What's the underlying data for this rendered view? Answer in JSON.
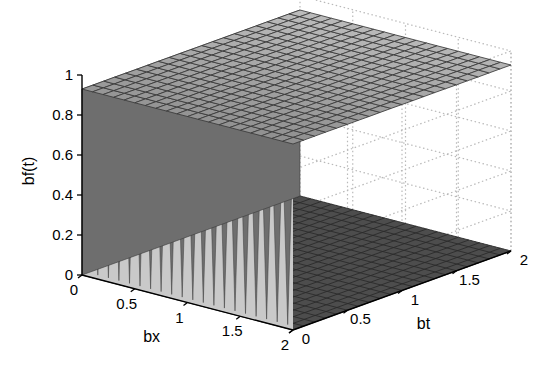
{
  "figure": {
    "type": "surface3d",
    "background": "#ffffff",
    "width": 534,
    "height": 383
  },
  "chart_data": {
    "type": "surface",
    "title": "",
    "xlabel": "bx",
    "ylabel": "bt",
    "zlabel": "bf(t)",
    "xlim": [
      0,
      2
    ],
    "ylim": [
      0,
      2
    ],
    "zlim": [
      0,
      1
    ],
    "xticks": [
      "0",
      "0.5",
      "1",
      "1.5",
      "2"
    ],
    "xtick_values": [
      0,
      0.5,
      1,
      1.5,
      2
    ],
    "yticks": [
      "0",
      "0.5",
      "1",
      "1.5",
      "2"
    ],
    "ytick_values": [
      0,
      0.5,
      1,
      1.5,
      2
    ],
    "zticks": [
      "0",
      "0.2",
      "0.4",
      "0.6",
      "0.8",
      "1"
    ],
    "ztick_values": [
      0,
      0.2,
      0.4,
      0.6,
      0.8,
      1
    ],
    "grid": true,
    "grid_style": "dotted",
    "legend": "none",
    "nx": 21,
    "ny": 21,
    "surface_plateau_z": 1.0,
    "surface_floor_z": 0.0,
    "tooth_count_front": 20,
    "colors": {
      "face_light": "#c9c9c9",
      "face_mid": "#a8a8a8",
      "face_dark": "#6e6e6e",
      "floor_dark": "#4d4d4d",
      "mesh_line": "#3a3a3a",
      "axis_line": "#000000",
      "grid_dotted": "#b9b9b9",
      "text": "#000000"
    }
  },
  "axes": {
    "z": {
      "label": "bf(t)",
      "ticks": [
        "1",
        "0.8",
        "0.6",
        "0.4",
        "0.2",
        "0"
      ]
    },
    "x": {
      "label": "bx",
      "ticks": [
        "0",
        "0.5",
        "1",
        "1.5",
        "2"
      ]
    },
    "y": {
      "label": "bt",
      "ticks": [
        "0",
        "0.5",
        "1",
        "1.5",
        "2"
      ]
    }
  }
}
